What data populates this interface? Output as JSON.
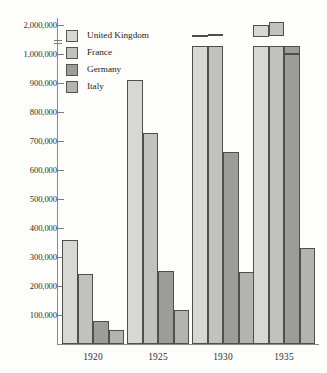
{
  "chart_data": {
    "type": "bar",
    "title": "",
    "subtitle": "",
    "xlabel": "",
    "ylabel": "",
    "categories": [
      "1920",
      "1925",
      "1930",
      "1935"
    ],
    "series": [
      {
        "name": "United Kingdom",
        "color": "#d8d8d2",
        "values": [
          360000,
          910000,
          1650000,
          2000000
        ]
      },
      {
        "name": "France",
        "color": "#c2c2bc",
        "values": [
          243000,
          727000,
          1700000,
          2100000
        ]
      },
      {
        "name": "Germany",
        "color": "#9d9d98",
        "values": [
          78000,
          253000,
          663000,
          1030000
        ]
      },
      {
        "name": "Italy",
        "color": "#b4b4ae",
        "values": [
          50000,
          117000,
          248000,
          330000
        ]
      }
    ],
    "y_tick_labels": [
      "100,000",
      "200,000",
      "300,000",
      "400,000",
      "500,000",
      "600,000",
      "700,000",
      "800,000",
      "900,000",
      "1,000,000",
      "2,000,000"
    ],
    "y_tick_values": [
      100000,
      200000,
      300000,
      400000,
      500000,
      600000,
      700000,
      800000,
      900000,
      1000000,
      2000000
    ],
    "ylim": [
      0,
      2000000
    ],
    "axis_break": {
      "present": true,
      "between": [
        1000000,
        2000000
      ]
    },
    "grid": false,
    "legend_position": "top-left",
    "legend_entries": [
      "United Kingdom",
      "France",
      "Germany",
      "Italy"
    ]
  },
  "legend": {
    "items": [
      {
        "label": "United Kingdom"
      },
      {
        "label": "France"
      },
      {
        "label": "Germany"
      },
      {
        "label": "Italy"
      }
    ]
  },
  "axes": {
    "y_labels": [
      "2,000,000",
      "1,000,000",
      "900,000",
      "800,000",
      "700,000",
      "600,000",
      "500,000",
      "400,000",
      "300,000",
      "200,000",
      "100,000"
    ],
    "x_labels": [
      "1920",
      "1925",
      "1930",
      "1935"
    ]
  }
}
